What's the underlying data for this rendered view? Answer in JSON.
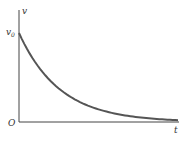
{
  "chart_data": {
    "type": "line",
    "title": "",
    "xlabel": "t",
    "ylabel": "v",
    "origin_label": "O",
    "y_tick_labels": [
      "v₀"
    ],
    "y0_label": "v",
    "y0_subscript": "0",
    "series": [
      {
        "name": "v(t)",
        "x": [
          0,
          0.1,
          0.2,
          0.3,
          0.4,
          0.5,
          0.6,
          0.7,
          0.8,
          0.9,
          1.0
        ],
        "values": [
          1.0,
          0.74,
          0.55,
          0.41,
          0.3,
          0.22,
          0.16,
          0.11,
          0.07,
          0.04,
          0.02
        ]
      }
    ],
    "xlim": [
      0,
      1
    ],
    "ylim": [
      0,
      1.3
    ],
    "grid": false,
    "legend": "none",
    "colors": {
      "curve": "#555555",
      "axes": "#444444"
    }
  }
}
